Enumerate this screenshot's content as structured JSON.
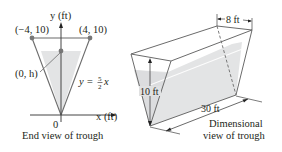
{
  "end_view": {
    "caption": "End view of trough",
    "y_axis_label": "y (ft)",
    "x_axis_label": "x (ft)",
    "origin_label": "0",
    "point_left": "(−4, 10)",
    "point_right": "(4, 10)",
    "point_h": "(0, h)",
    "equation_lhs": "y = ",
    "equation_num": "5",
    "equation_den": "2",
    "equation_var": "x"
  },
  "dimensional_view": {
    "caption_line1": "Dimensional",
    "caption_line2": "view of trough",
    "width_label": "8 ft",
    "height_label": "10 ft",
    "length_label": "30 ft"
  },
  "colors": {
    "line": "#5a5a5a",
    "water": "#e3e4e5",
    "text": "#231f20"
  }
}
